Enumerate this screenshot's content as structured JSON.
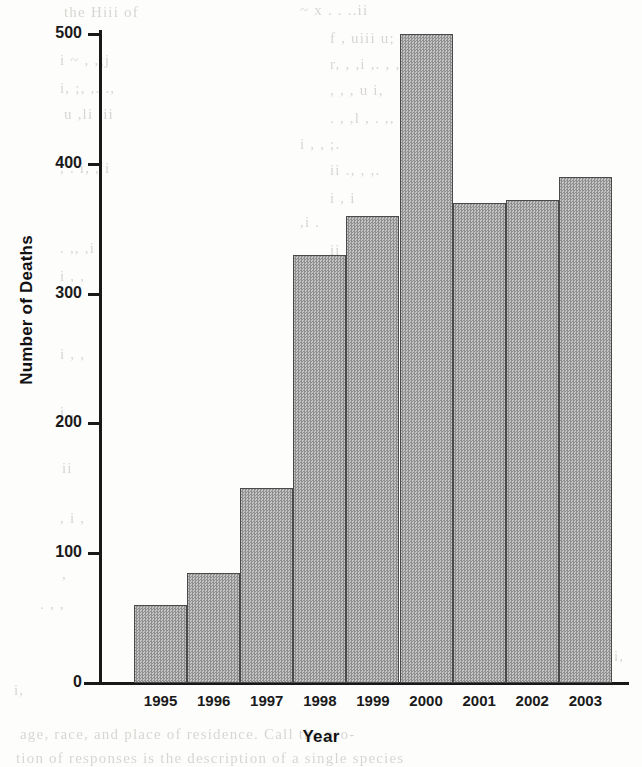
{
  "chart_data": {
    "type": "bar",
    "title": "",
    "xlabel": "Year",
    "ylabel": "Number of Deaths",
    "categories": [
      "1995",
      "1996",
      "1997",
      "1998",
      "1999",
      "2000",
      "2001",
      "2002",
      "2003"
    ],
    "values": [
      60,
      85,
      150,
      330,
      360,
      500,
      370,
      372,
      390
    ],
    "ylim": [
      0,
      500
    ],
    "y_ticks": [
      "0",
      "100",
      "200",
      "300",
      "400",
      "500"
    ],
    "y_tick_values": [
      0,
      100,
      200,
      300,
      400,
      500
    ],
    "grid": false,
    "legend": null,
    "bar_fill_color": "#a8a8a8",
    "bar_border_color": "#4a4a4a",
    "axis_color": "#191919",
    "background_color": "#fdfdfc"
  },
  "page": {
    "ghost_text": [
      {
        "text": "the  Hiii   of",
        "x": 64,
        "y": 4
      },
      {
        "text": "~  x  . .  ..ii",
        "x": 300,
        "y": 2
      },
      {
        "text": "f ,  uiii   u;",
        "x": 330,
        "y": 30
      },
      {
        "text": "i   ~ ,   ,;j",
        "x": 60,
        "y": 52
      },
      {
        "text": "r,  ,    ,i   ,.     , , ...",
        "x": 330,
        "y": 56
      },
      {
        "text": "i, ;,   ,.   .,",
        "x": 60,
        "y": 80
      },
      {
        "text": ",      ,  ,   u   i,",
        "x": 330,
        "y": 82
      },
      {
        "text": "u   ,li   ,ii",
        "x": 64,
        "y": 106
      },
      {
        "text": ".   ,    ,l  , .  ,,",
        "x": 330,
        "y": 110
      },
      {
        "text": "i  ,  , ;.",
        "x": 300,
        "y": 136
      },
      {
        "text": ",  .  i,    ,    i",
        "x": 60,
        "y": 160
      },
      {
        "text": "ii  .,    ,    ,.",
        "x": 330,
        "y": 162
      },
      {
        "text": "i     ,  i",
        "x": 330,
        "y": 190
      },
      {
        "text": ",i   .",
        "x": 300,
        "y": 214
      },
      {
        "text": ".  ,,    ,i",
        "x": 60,
        "y": 240
      },
      {
        "text": "ii   ,  .,",
        "x": 330,
        "y": 242
      },
      {
        "text": "i ,   ,",
        "x": 60,
        "y": 268
      },
      {
        "text": "i    ,",
        "x": 320,
        "y": 270
      },
      {
        "text": "., ,",
        "x": 300,
        "y": 296
      },
      {
        "text": "ii   .",
        "x": 340,
        "y": 322
      },
      {
        "text": "i , ,",
        "x": 60,
        "y": 346
      },
      {
        "text": ",.",
        "x": 320,
        "y": 350
      },
      {
        "text": ",i",
        "x": 300,
        "y": 376
      },
      {
        "text": "i  ,",
        "x": 60,
        "y": 404
      },
      {
        "text": "i",
        "x": 300,
        "y": 430
      },
      {
        "text": "ii",
        "x": 62,
        "y": 460
      },
      {
        "text": ",",
        "x": 300,
        "y": 486
      },
      {
        "text": ", i ,",
        "x": 60,
        "y": 510
      },
      {
        "text": "u",
        "x": 300,
        "y": 540
      },
      {
        "text": ",",
        "x": 62,
        "y": 566
      },
      {
        "text": ". ,   ,",
        "x": 40,
        "y": 596
      },
      {
        "text": "i",
        "x": 600,
        "y": 620
      },
      {
        "text": "i,",
        "x": 614,
        "y": 648
      },
      {
        "text": "i,",
        "x": 14,
        "y": 682
      },
      {
        "text": "age, race, and place of residence. Call the pro-",
        "x": 20,
        "y": 726
      },
      {
        "text": "tion of responses is the description of a single species",
        "x": 16,
        "y": 750
      }
    ]
  }
}
